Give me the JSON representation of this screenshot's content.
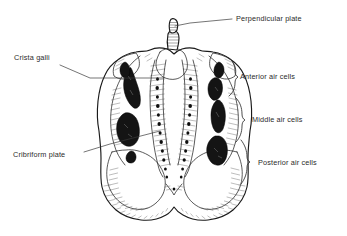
{
  "figure": {
    "background_color": "#ffffff",
    "ink_color": "#1a1a1a",
    "text_color": "#2b2b2b",
    "aircell_fill": "#141414"
  },
  "labels": {
    "perpendicular_plate": "Perpendicular plate",
    "crista_galli": "Crista galli",
    "cribriform_plate": "Cribriform plate",
    "anterior_air_cells": "Anterior air cells",
    "middle_air_cells": "Middle air cells",
    "posterior_air_cells": "Posterior air cells"
  },
  "label_list": [
    {
      "id": "perpendicular-plate",
      "text": "Perpendicular plate",
      "side": "top-right",
      "x": 236,
      "y": 21
    },
    {
      "id": "crista-galli",
      "text": "Crista galli",
      "side": "left",
      "x": 14,
      "y": 60
    },
    {
      "id": "cribriform-plate",
      "text": "Cribriform plate",
      "side": "left",
      "x": 13,
      "y": 155
    },
    {
      "id": "anterior-air-cells",
      "text": "Anterior air cells",
      "side": "right",
      "x": 237,
      "y": 76
    },
    {
      "id": "middle-air-cells",
      "text": "Middle air cells",
      "side": "right",
      "x": 254,
      "y": 119
    },
    {
      "id": "posterior-air-cells",
      "text": "Posterior air cells",
      "side": "right",
      "x": 261,
      "y": 159
    }
  ],
  "structures": [
    {
      "name": "perpendicular-plate",
      "description": "small vertical stub projecting above the crista galli at top center"
    },
    {
      "name": "crista-galli",
      "description": "midline vertical ridge rising from the cribriform plate"
    },
    {
      "name": "cribriform-plate",
      "description": "paired perforated grooves flanking the crista galli"
    },
    {
      "name": "ethmoidal-labyrinth-left",
      "description": "left lateral mass containing air cells"
    },
    {
      "name": "ethmoidal-labyrinth-right",
      "description": "right lateral mass containing air cells"
    },
    {
      "name": "anterior-air-cells",
      "description": "dark cavities in the upper portion of each labyrinth"
    },
    {
      "name": "middle-air-cells",
      "description": "dark cavities in the mid portion of each labyrinth"
    },
    {
      "name": "posterior-air-cells",
      "description": "dark cavities in the lower portion of each labyrinth"
    }
  ]
}
